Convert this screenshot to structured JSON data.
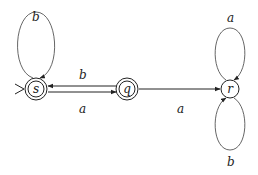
{
  "diagram": {
    "type": "finite-state-automaton",
    "states": [
      {
        "id": "s",
        "label": "s",
        "accepting": true,
        "initial": true
      },
      {
        "id": "q",
        "label": "q",
        "accepting": true,
        "initial": false
      },
      {
        "id": "r",
        "label": "r",
        "accepting": false,
        "initial": false
      }
    ],
    "transitions": [
      {
        "from": "s",
        "to": "s",
        "label": "b"
      },
      {
        "from": "q",
        "to": "s",
        "label": "b"
      },
      {
        "from": "s",
        "to": "q",
        "label": "a"
      },
      {
        "from": "q",
        "to": "r",
        "label": "a"
      },
      {
        "from": "r",
        "to": "r",
        "label": "a",
        "position": "top"
      },
      {
        "from": "r",
        "to": "r",
        "label": "b",
        "position": "bottom"
      }
    ],
    "colors": {
      "stroke": "#222222",
      "loop_stroke": "#555555",
      "background": "#ffffff"
    }
  }
}
